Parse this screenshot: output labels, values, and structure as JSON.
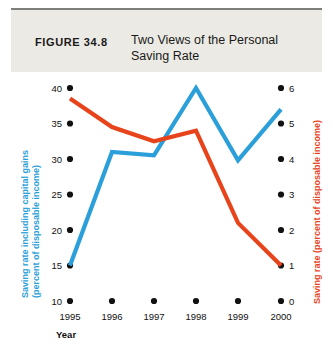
{
  "figure": {
    "number_label": "FIGURE  34.8",
    "title_line1": "Two Views of the Personal",
    "title_line2": "Saving Rate",
    "title_full": "Two Views of the Personal Saving Rate"
  },
  "colors": {
    "blue_series": "#2B9FDA",
    "red_series": "#E8441C",
    "header_band": "#eceae4",
    "header_rule": "#7d7f7c",
    "text": "#111111",
    "background": "#ffffff"
  },
  "axes": {
    "x": {
      "title": "Year",
      "tick_labels": [
        "1995",
        "1996",
        "1997",
        "1998",
        "1999",
        "2000"
      ]
    },
    "left": {
      "title_line1": "Saving rate including capital gains",
      "title_line2": "(percent of disposable income)",
      "title_full": "Saving rate including capital gains (percent of disposable income)",
      "tick_labels": [
        "40",
        "35",
        "30",
        "25",
        "20",
        "15",
        "10"
      ],
      "min": 10,
      "max": 40,
      "step": 5,
      "color": "#2B9FDA"
    },
    "right": {
      "title": "Saving rate  (percent of disposable income)",
      "tick_labels": [
        "6",
        "5",
        "4",
        "3",
        "2",
        "1",
        "0"
      ],
      "min": 0,
      "max": 6,
      "step": 1,
      "color": "#E8441C"
    }
  },
  "chart_data": {
    "type": "line",
    "title": "Two Views of the Personal Saving Rate",
    "xlabel": "Year",
    "ylabel": "Saving rate including capital gains (percent of disposable income)",
    "y2label": "Saving rate (percent of disposable income)",
    "x": [
      "1995",
      "1996",
      "1997",
      "1998",
      "1999",
      "2000"
    ],
    "ylim": [
      10,
      40
    ],
    "y2lim": [
      0,
      6
    ],
    "grid": false,
    "legend": "none",
    "series": [
      {
        "name": "Saving rate including capital gains (percent of disposable income)",
        "axis": "left",
        "color": "#2B9FDA",
        "values": [
          15.0,
          31.0,
          30.5,
          40.0,
          29.8,
          37.0
        ]
      },
      {
        "name": "Saving rate (percent of disposable income)",
        "axis": "right",
        "color": "#E8441C",
        "values": [
          5.7,
          4.9,
          4.5,
          4.8,
          2.2,
          1.0
        ]
      }
    ]
  }
}
